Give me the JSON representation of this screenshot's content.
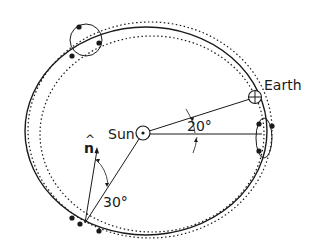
{
  "diagram": {
    "labels": {
      "sun": "Sun",
      "earth": "Earth",
      "normal": "n",
      "normal_hat": "^",
      "angle_earth": "20°",
      "angle_normal": "30°"
    },
    "colors": {
      "stroke": "#1a1a1a",
      "background": "#ffffff"
    }
  }
}
